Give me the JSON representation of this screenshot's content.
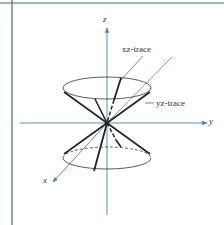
{
  "figure": {
    "axes": {
      "x_label": "x",
      "y_label": "y",
      "z_label": "z"
    },
    "annotations": {
      "xz_trace": "xz-trace",
      "yz_trace": "yz-trace"
    },
    "colors": {
      "axis": "#4a7fb5",
      "frame": "#3a6a9a",
      "cone": "#222222"
    }
  }
}
